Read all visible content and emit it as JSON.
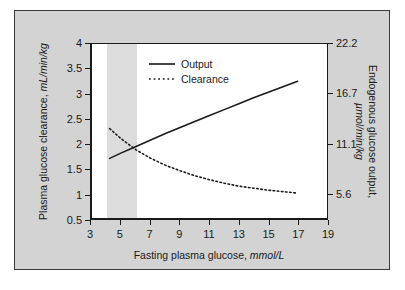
{
  "chart_data": {
    "type": "line",
    "title": "",
    "xlabel": "Fasting plasma glucose, mmol/L",
    "ylabel": "Plasma glucose clearance, mL/min/kg",
    "y2label": "Endogenous glucose output, µmol/min/kg",
    "xlim": [
      3,
      19
    ],
    "ylim": [
      0.5,
      4
    ],
    "y2lim": [
      2.8,
      22.2
    ],
    "grid": false,
    "legend_position": "upper-left-inside",
    "xticks": [
      3,
      5,
      7,
      9,
      11,
      13,
      15,
      17,
      19
    ],
    "xtick_labels": [
      "3",
      "5",
      "7",
      "9",
      "11",
      "13",
      "15",
      "17",
      "19"
    ],
    "yticks": [
      0.5,
      1,
      1.5,
      2,
      2.5,
      3,
      3.5,
      4
    ],
    "ytick_labels": [
      "0.5",
      "1",
      "1.5",
      "2",
      "2.5",
      "3",
      "3.5",
      "4"
    ],
    "y2ticks": [
      5.6,
      11.1,
      16.7,
      22.2
    ],
    "y2tick_labels": [
      "5.6",
      "11.1",
      "16.7",
      "22.2"
    ],
    "shaded_band": {
      "label": "normal fasting glucose band",
      "x_start": 4,
      "x_end": 6,
      "color": "#dcdcdc"
    },
    "series": [
      {
        "name": "Output",
        "axis": "right",
        "style": "solid",
        "color": "#1a1a1a",
        "x": [
          4.2,
          5,
          6,
          7,
          8,
          9,
          10,
          11,
          12,
          13,
          14,
          15,
          16,
          17
        ],
        "values": [
          1.7,
          1.81,
          1.94,
          2.07,
          2.2,
          2.32,
          2.44,
          2.56,
          2.68,
          2.8,
          2.92,
          3.03,
          3.14,
          3.25
        ]
      },
      {
        "name": "Clearance",
        "axis": "left",
        "style": "dotted",
        "color": "#1a1a1a",
        "x": [
          4.2,
          5,
          6,
          7,
          8,
          9,
          10,
          11,
          12,
          13,
          14,
          15,
          16,
          17
        ],
        "values": [
          2.3,
          2.09,
          1.87,
          1.7,
          1.56,
          1.45,
          1.35,
          1.27,
          1.2,
          1.14,
          1.1,
          1.06,
          1.03,
          1.0
        ]
      }
    ],
    "annotations": []
  },
  "legend": {
    "items": [
      {
        "label": "Output",
        "style": "solid"
      },
      {
        "label": "Clearance",
        "style": "dotted"
      }
    ]
  },
  "axes": {
    "x_title_main": "Fasting plasma glucose, ",
    "x_title_unit": "mmol/L",
    "y_left_title_main": "Plasma glucose clearance, ",
    "y_left_title_unit": "mL/min/kg",
    "y_right_title_main": "Endogenous glucose output,",
    "y_right_title_unit": "µmol/min/kg"
  },
  "colors": {
    "panel_background": "#d3d3d3",
    "plot_background": "#ffffff",
    "band": "#dcdcdc",
    "ink": "#1a1a1a",
    "border": "#3a3a3a"
  }
}
